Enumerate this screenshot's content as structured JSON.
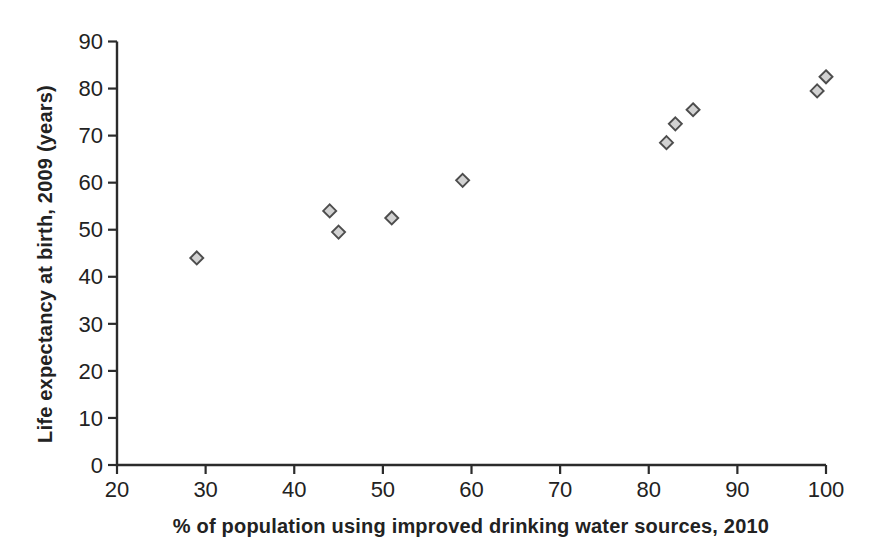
{
  "chart_data": {
    "type": "scatter",
    "title": "",
    "xlabel": "% of population using improved drinking water sources, 2010",
    "ylabel": "Life expectancy at birth, 2009 (years)",
    "xlim": [
      20,
      100
    ],
    "ylim": [
      0,
      90
    ],
    "x_ticks": [
      20,
      30,
      40,
      50,
      60,
      70,
      80,
      90,
      100
    ],
    "y_ticks": [
      0,
      10,
      20,
      30,
      40,
      50,
      60,
      70,
      80,
      90
    ],
    "grid": false,
    "legend": "none",
    "axis_color": "#2b2b2b",
    "text_color": "#222222",
    "marker": {
      "shape": "diamond",
      "fill": "#d2d2d2",
      "stroke": "#4d4d4d",
      "size": 13
    },
    "points": [
      {
        "x": 29,
        "y": 44
      },
      {
        "x": 44,
        "y": 54
      },
      {
        "x": 45,
        "y": 49.5
      },
      {
        "x": 51,
        "y": 52.5
      },
      {
        "x": 59,
        "y": 60.5
      },
      {
        "x": 82,
        "y": 68.5
      },
      {
        "x": 83,
        "y": 72.5
      },
      {
        "x": 85,
        "y": 75.5
      },
      {
        "x": 99,
        "y": 79.5
      },
      {
        "x": 100,
        "y": 82.5
      }
    ]
  }
}
